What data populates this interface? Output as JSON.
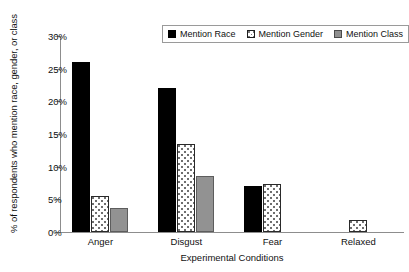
{
  "chart_data": {
    "type": "bar",
    "title": "",
    "xlabel": "Experimental Conditions",
    "ylabel": "% of respondents who mention race, gender, or class",
    "categories": [
      "Anger",
      "Disgust",
      "Fear",
      "Relaxed"
    ],
    "series": [
      {
        "name": "Mention Race",
        "values": [
          26.0,
          22.0,
          7.1,
          0
        ]
      },
      {
        "name": "Mention Gender",
        "values": [
          5.5,
          13.5,
          7.3,
          1.8
        ]
      },
      {
        "name": "Mention Class",
        "values": [
          3.6,
          8.6,
          0,
          0
        ]
      }
    ],
    "ylim": [
      0,
      30
    ],
    "yticks": [
      0,
      5,
      10,
      15,
      20,
      25,
      30
    ],
    "ytick_labels": [
      "0%",
      "5%",
      "10%",
      "15%",
      "20%",
      "25%",
      "30%"
    ],
    "grid": false,
    "legend_position": "top-right",
    "colors": {
      "race": "#000000",
      "gender": "#ffffff",
      "class": "#929292",
      "axis": "#8d8d8d",
      "text": "#111111",
      "background": "#ffffff"
    }
  },
  "legend": {
    "items": [
      {
        "label": "Mention Race",
        "swatch": "black-filled-square-icon"
      },
      {
        "label": "Mention Gender",
        "swatch": "dotted-square-icon"
      },
      {
        "label": "Mention Class",
        "swatch": "gray-filled-square-icon"
      }
    ]
  }
}
